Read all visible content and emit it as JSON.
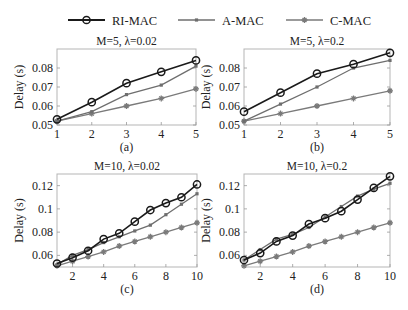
{
  "legend": {
    "items": [
      {
        "label": "RI-MAC",
        "color": "#1a1a1a",
        "marker": "circle"
      },
      {
        "label": "A-MAC",
        "color": "#6e6e6e",
        "marker": "dot"
      },
      {
        "label": "C-MAC",
        "color": "#7a7a7a",
        "marker": "star"
      }
    ]
  },
  "chart_data": [
    {
      "type": "line",
      "id": "a",
      "title": "M=5, λ=0.02",
      "caption": "(a)",
      "xlabel": "",
      "ylabel": "Delay (s)",
      "x": [
        1,
        2,
        3,
        4,
        5
      ],
      "xticks": [
        1,
        2,
        3,
        4,
        5
      ],
      "xlim": [
        1,
        5
      ],
      "yticks": [
        0.05,
        0.06,
        0.07,
        0.08
      ],
      "ytick_labels": [
        "0.05",
        "0.06",
        "0.07",
        "0.08"
      ],
      "ylim": [
        0.05,
        0.09
      ],
      "grid": false,
      "series": [
        {
          "name": "RI-MAC",
          "values": [
            0.053,
            0.062,
            0.072,
            0.078,
            0.084
          ]
        },
        {
          "name": "A-MAC",
          "values": [
            0.052,
            0.057,
            0.066,
            0.071,
            0.081
          ]
        },
        {
          "name": "C-MAC",
          "values": [
            0.052,
            0.056,
            0.06,
            0.064,
            0.069
          ]
        }
      ]
    },
    {
      "type": "line",
      "id": "b",
      "title": "M=5, λ=0.2",
      "caption": "(b)",
      "xlabel": "",
      "ylabel": "Delay (s)",
      "x": [
        1,
        2,
        3,
        4,
        5
      ],
      "xticks": [
        1,
        2,
        3,
        4,
        5
      ],
      "xlim": [
        1,
        5
      ],
      "yticks": [
        0.05,
        0.06,
        0.07,
        0.08
      ],
      "ytick_labels": [
        "0.05",
        "0.06",
        "0.07",
        "0.08"
      ],
      "ylim": [
        0.05,
        0.09
      ],
      "grid": false,
      "series": [
        {
          "name": "RI-MAC",
          "values": [
            0.057,
            0.067,
            0.077,
            0.082,
            0.088
          ]
        },
        {
          "name": "A-MAC",
          "values": [
            0.052,
            0.061,
            0.07,
            0.08,
            0.084
          ]
        },
        {
          "name": "C-MAC",
          "values": [
            0.052,
            0.056,
            0.06,
            0.064,
            0.068
          ]
        }
      ]
    },
    {
      "type": "line",
      "id": "c",
      "title": "M=10, λ=0.02",
      "caption": "(c)",
      "xlabel": "",
      "ylabel": "Delay (s)",
      "x": [
        1,
        2,
        3,
        4,
        5,
        6,
        7,
        8,
        9,
        10
      ],
      "xticks": [
        2,
        4,
        6,
        8,
        10
      ],
      "xlim": [
        1,
        10
      ],
      "yticks": [
        0.06,
        0.08,
        0.1,
        0.12
      ],
      "ytick_labels": [
        "0.06",
        "0.08",
        "0.1",
        "0.12"
      ],
      "ylim": [
        0.05,
        0.13
      ],
      "grid": false,
      "series": [
        {
          "name": "RI-MAC",
          "values": [
            0.053,
            0.058,
            0.064,
            0.074,
            0.079,
            0.089,
            0.099,
            0.105,
            0.11,
            0.121
          ]
        },
        {
          "name": "A-MAC",
          "values": [
            0.052,
            0.06,
            0.065,
            0.071,
            0.076,
            0.081,
            0.086,
            0.095,
            0.104,
            0.113
          ]
        },
        {
          "name": "C-MAC",
          "values": [
            0.051,
            0.055,
            0.059,
            0.063,
            0.068,
            0.072,
            0.076,
            0.08,
            0.084,
            0.088
          ]
        }
      ]
    },
    {
      "type": "line",
      "id": "d",
      "title": "M=10, λ=0.2",
      "caption": "(d)",
      "xlabel": "",
      "ylabel": "Delay (s)",
      "x": [
        1,
        2,
        3,
        4,
        5,
        6,
        7,
        8,
        9,
        10
      ],
      "xticks": [
        2,
        4,
        6,
        8,
        10
      ],
      "xlim": [
        1,
        10
      ],
      "yticks": [
        0.06,
        0.08,
        0.1,
        0.12
      ],
      "ytick_labels": [
        "0.06",
        "0.08",
        "0.1",
        "0.12"
      ],
      "ylim": [
        0.05,
        0.13
      ],
      "grid": false,
      "series": [
        {
          "name": "RI-MAC",
          "values": [
            0.056,
            0.062,
            0.072,
            0.077,
            0.087,
            0.092,
            0.098,
            0.108,
            0.118,
            0.128
          ]
        },
        {
          "name": "A-MAC",
          "values": [
            0.056,
            0.065,
            0.074,
            0.078,
            0.084,
            0.093,
            0.102,
            0.111,
            0.117,
            0.122
          ]
        },
        {
          "name": "C-MAC",
          "values": [
            0.051,
            0.055,
            0.059,
            0.063,
            0.068,
            0.072,
            0.076,
            0.08,
            0.084,
            0.088
          ]
        }
      ]
    }
  ]
}
